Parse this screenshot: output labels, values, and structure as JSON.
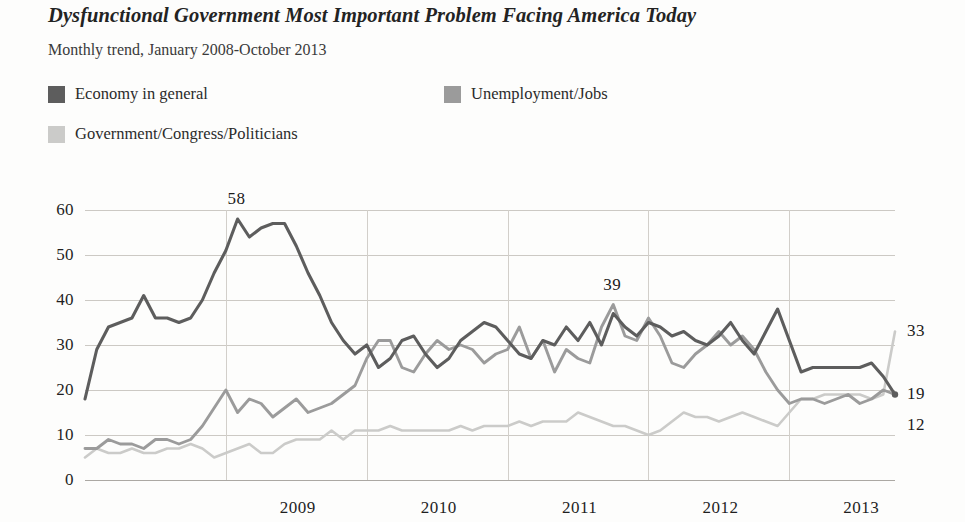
{
  "header": {
    "title": "Dysfunctional Government Most Important Problem Facing America Today",
    "subtitle": "Monthly trend, January 2008-October 2013"
  },
  "legend": {
    "position": "top",
    "items": [
      {
        "label": "Economy in general",
        "color": "#5d5d5d",
        "swatch": "legend-swatch-economy"
      },
      {
        "label": "Unemployment/Jobs",
        "color": "#9b9b9b",
        "swatch": "legend-swatch-unemployment"
      },
      {
        "label": "Government/Congress/Politicians",
        "color": "#cbcbc9",
        "swatch": "legend-swatch-government"
      }
    ]
  },
  "chart_data": {
    "type": "line",
    "title": "Dysfunctional Government Most Important Problem Facing America Today",
    "subtitle": "Monthly trend, January 2008-October 2013",
    "xlabel": "",
    "ylabel": "",
    "ylim": [
      0,
      60
    ],
    "yticks": [
      0,
      10,
      20,
      30,
      40,
      50,
      60
    ],
    "xticks": [
      "2009",
      "2010",
      "2011",
      "2012",
      "2013"
    ],
    "xtick_positions": [
      12,
      24,
      36,
      48,
      60
    ],
    "grid": true,
    "x": [
      "Jan 2008",
      "Feb 2008",
      "Mar 2008",
      "Apr 2008",
      "May 2008",
      "Jun 2008",
      "Jul 2008",
      "Aug 2008",
      "Sep 2008",
      "Oct 2008",
      "Nov 2008",
      "Dec 2008",
      "Jan 2009",
      "Feb 2009",
      "Mar 2009",
      "Apr 2009",
      "May 2009",
      "Jun 2009",
      "Jul 2009",
      "Aug 2009",
      "Sep 2009",
      "Oct 2009",
      "Nov 2009",
      "Dec 2009",
      "Jan 2010",
      "Feb 2010",
      "Mar 2010",
      "Apr 2010",
      "May 2010",
      "Jun 2010",
      "Jul 2010",
      "Aug 2010",
      "Sep 2010",
      "Oct 2010",
      "Nov 2010",
      "Dec 2010",
      "Jan 2011",
      "Feb 2011",
      "Mar 2011",
      "Apr 2011",
      "May 2011",
      "Jun 2011",
      "Jul 2011",
      "Aug 2011",
      "Sep 2011",
      "Oct 2011",
      "Nov 2011",
      "Dec 2011",
      "Jan 2012",
      "Feb 2012",
      "Mar 2012",
      "Apr 2012",
      "May 2012",
      "Jun 2012",
      "Jul 2012",
      "Aug 2012",
      "Sep 2012",
      "Oct 2012",
      "Nov 2012",
      "Dec 2012",
      "Jan 2013",
      "Feb 2013",
      "Mar 2013",
      "Apr 2013",
      "May 2013",
      "Jun 2013",
      "Jul 2013",
      "Aug 2013",
      "Sep 2013",
      "Oct 2013"
    ],
    "series": [
      {
        "name": "Economy in general",
        "color": "#5d5d5d",
        "values": [
          18,
          29,
          34,
          35,
          36,
          41,
          36,
          36,
          35,
          36,
          40,
          46,
          51,
          58,
          54,
          56,
          57,
          57,
          52,
          46,
          41,
          35,
          31,
          28,
          30,
          25,
          27,
          31,
          32,
          28,
          25,
          27,
          31,
          33,
          35,
          34,
          31,
          28,
          27,
          31,
          30,
          34,
          31,
          35,
          30,
          37,
          34,
          32,
          35,
          34,
          32,
          33,
          31,
          30,
          32,
          35,
          31,
          28,
          33,
          38,
          31,
          24,
          25,
          25,
          25,
          25,
          25,
          26,
          23,
          19
        ]
      },
      {
        "name": "Unemployment/Jobs",
        "color": "#9b9b9b",
        "values": [
          7,
          7,
          9,
          8,
          8,
          7,
          9,
          9,
          8,
          9,
          12,
          16,
          20,
          15,
          18,
          17,
          14,
          16,
          18,
          15,
          16,
          17,
          19,
          21,
          27,
          31,
          31,
          25,
          24,
          28,
          31,
          29,
          30,
          29,
          26,
          28,
          29,
          34,
          27,
          31,
          24,
          29,
          27,
          26,
          34,
          39,
          32,
          31,
          36,
          32,
          26,
          25,
          28,
          30,
          33,
          30,
          32,
          29,
          24,
          20,
          17,
          18,
          18,
          17,
          18,
          19,
          17,
          18,
          20,
          19
        ]
      },
      {
        "name": "Government/Congress/Politicians",
        "color": "#cbcbc9",
        "values": [
          5,
          7,
          6,
          6,
          7,
          6,
          6,
          7,
          7,
          8,
          7,
          5,
          6,
          7,
          8,
          6,
          6,
          8,
          9,
          9,
          9,
          11,
          9,
          11,
          11,
          11,
          12,
          11,
          11,
          11,
          11,
          11,
          12,
          11,
          12,
          12,
          12,
          13,
          12,
          13,
          13,
          13,
          15,
          14,
          13,
          12,
          12,
          11,
          10,
          11,
          13,
          15,
          14,
          14,
          13,
          14,
          15,
          14,
          13,
          12,
          15,
          18,
          18,
          19,
          19,
          19,
          19,
          18,
          19,
          33
        ]
      }
    ],
    "annotations": [
      {
        "text": "58",
        "index": 13,
        "value": 58,
        "series": "Economy in general",
        "placement": "above"
      },
      {
        "text": "39",
        "index": 45,
        "value": 39,
        "series": "Unemployment/Jobs",
        "placement": "above"
      },
      {
        "text": "33",
        "index": 69,
        "value": 33,
        "series": "Government/Congress/Politicians",
        "placement": "right"
      },
      {
        "text": "19",
        "index": 69,
        "value": 19,
        "series": "Unemployment/Jobs",
        "placement": "right"
      },
      {
        "text": "12",
        "index": 69,
        "value": 12,
        "series": "Economy in general",
        "placement": "right"
      }
    ]
  }
}
